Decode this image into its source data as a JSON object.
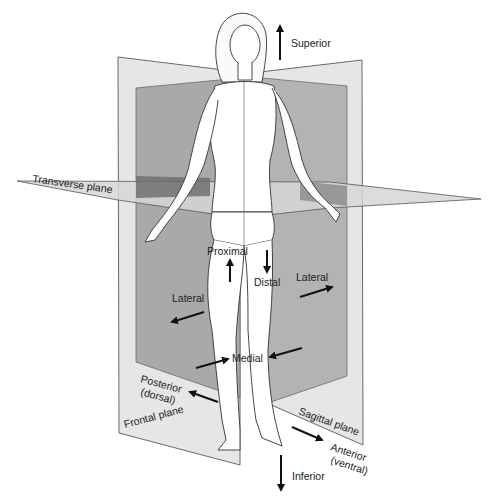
{
  "colors": {
    "plane_light": "#e6e6e6",
    "plane_dark": "#a9a9a9",
    "plane_outline": "#6a6a6a",
    "transverse_light": "#d2d2d2",
    "transverse_dark": "#7a7a7a",
    "figure_fill": "#ffffff",
    "figure_stroke": "#333333",
    "arrow": "#111111",
    "text": "#222222"
  },
  "planes": {
    "transverse": "Transverse plane",
    "frontal": "Frontal plane",
    "sagittal": "Sagittal plane"
  },
  "directions": {
    "superior": "Superior",
    "inferior": "Inferior",
    "proximal": "Proximal",
    "distal": "Distal",
    "lateral_left": "Lateral",
    "lateral_right": "Lateral",
    "medial": "Medial",
    "posterior_line1": "Posterior",
    "posterior_line2": "(dorsal)",
    "anterior_line1": "Anterior",
    "anterior_line2": "(ventral)"
  }
}
